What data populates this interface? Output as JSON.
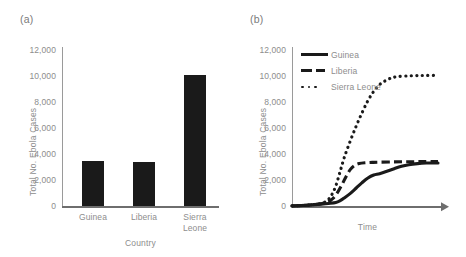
{
  "figure": {
    "panels": [
      {
        "label": "(a)",
        "chart_ref": 0
      },
      {
        "label": "(b)",
        "chart_ref": 1
      }
    ]
  },
  "chart_data": [
    {
      "type": "bar",
      "title": "",
      "panel_label": "(a)",
      "categories": [
        "Guinea",
        "Liberia",
        "Sierra\nLeone"
      ],
      "values": [
        3350,
        3280,
        9800
      ],
      "xlabel": "Country",
      "ylabel": "Total No. Ebola Cases",
      "ylim": [
        0,
        12000
      ],
      "yticks": [
        0,
        2000,
        4000,
        6000,
        8000,
        10000,
        12000
      ],
      "ytick_labels": [
        "0",
        "2,000",
        "4,000",
        "6,000",
        "8,000",
        "10,000",
        "12,000"
      ],
      "grid": false,
      "bar_color": "#1a1a1a"
    },
    {
      "type": "line",
      "title": "",
      "panel_label": "(b)",
      "xlabel": "Time",
      "ylabel": "Total No. Ebola Cases",
      "ylim": [
        0,
        12000
      ],
      "yticks": [
        0,
        2000,
        4000,
        6000,
        8000,
        10000,
        12000
      ],
      "ytick_labels": [
        "0",
        "2,000",
        "4,000",
        "6,000",
        "8,000",
        "10,000",
        "12,000"
      ],
      "xlim": [
        0,
        100
      ],
      "xticks": [],
      "xtick_labels": [],
      "grid": false,
      "legend_position": "top-left",
      "series": [
        {
          "name": "Guinea",
          "style": "solid",
          "color": "#1a1a1a",
          "x": [
            0,
            5,
            10,
            15,
            20,
            25,
            30,
            33,
            36,
            40,
            44,
            48,
            52,
            56,
            60,
            65,
            70,
            75,
            80,
            86,
            92,
            100
          ],
          "y": [
            10,
            30,
            60,
            100,
            140,
            190,
            260,
            400,
            620,
            950,
            1350,
            1750,
            2100,
            2320,
            2420,
            2600,
            2800,
            2980,
            3100,
            3180,
            3220,
            3230
          ]
        },
        {
          "name": "Liberia",
          "style": "dashed",
          "color": "#1a1a1a",
          "x": [
            0,
            5,
            10,
            15,
            20,
            25,
            28,
            31,
            34,
            37,
            40,
            43,
            46,
            50,
            55,
            60,
            70,
            80,
            90,
            100
          ],
          "y": [
            10,
            30,
            60,
            110,
            170,
            320,
            560,
            980,
            1550,
            2200,
            2750,
            3050,
            3180,
            3240,
            3270,
            3290,
            3310,
            3320,
            3330,
            3330
          ]
        },
        {
          "name": "Sierra Leone",
          "style": "dotted",
          "color": "#1a1a1a",
          "x": [
            0,
            5,
            10,
            15,
            20,
            24,
            27,
            30,
            33,
            36,
            40,
            44,
            48,
            52,
            56,
            60,
            64,
            68,
            72,
            78,
            85,
            92,
            100
          ],
          "y": [
            10,
            30,
            60,
            110,
            190,
            400,
            800,
            1500,
            2600,
            3700,
            4900,
            6000,
            7000,
            7900,
            8600,
            9100,
            9400,
            9600,
            9700,
            9750,
            9780,
            9790,
            9800
          ]
        }
      ]
    }
  ]
}
